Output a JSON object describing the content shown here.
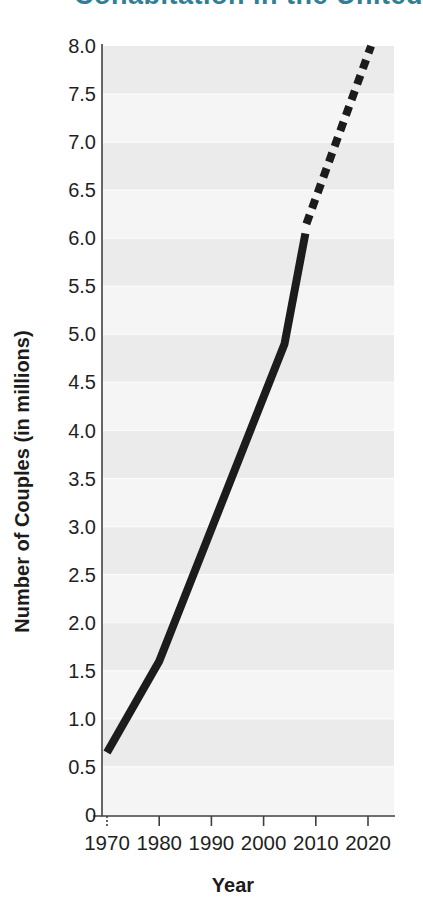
{
  "title": {
    "text": "Cohabitation in the United",
    "color": "#2f7f96",
    "note": "title clipped at top edge of screenshot"
  },
  "chart_data": {
    "type": "line",
    "title": "Cohabitation in the United",
    "xlabel": "Year",
    "ylabel": "Number of Couples (in millions)",
    "xlim": [
      1970,
      2022
    ],
    "ylim": [
      0,
      8.0
    ],
    "grid": "horizontal alternating bands every 0.5",
    "legend": "none",
    "x_ticks": [
      {
        "label": "1970",
        "year": 1970
      },
      {
        "label": "1980",
        "year": 1980
      },
      {
        "label": "1990",
        "year": 1990
      },
      {
        "label": "2000",
        "year": 2000
      },
      {
        "label": "2010",
        "year": 2010
      },
      {
        "label": "2020",
        "year": 2020
      }
    ],
    "y_ticks": [
      {
        "label": "0",
        "value": 0
      },
      {
        "label": "0.5",
        "value": 0.5
      },
      {
        "label": "1.0",
        "value": 1.0
      },
      {
        "label": "1.5",
        "value": 1.5
      },
      {
        "label": "2.0",
        "value": 2.0
      },
      {
        "label": "2.5",
        "value": 2.5
      },
      {
        "label": "3.0",
        "value": 3.0
      },
      {
        "label": "3.5",
        "value": 3.5
      },
      {
        "label": "4.0",
        "value": 4.0
      },
      {
        "label": "4.5",
        "value": 4.5
      },
      {
        "label": "5.0",
        "value": 5.0
      },
      {
        "label": "5.5",
        "value": 5.5
      },
      {
        "label": "6.0",
        "value": 6.0
      },
      {
        "label": "6.5",
        "value": 6.5
      },
      {
        "label": "7.0",
        "value": 7.0
      },
      {
        "label": "7.5",
        "value": 7.5
      },
      {
        "label": "8.0",
        "value": 8.0
      }
    ],
    "series": [
      {
        "name": "actual",
        "style": "solid",
        "points": [
          [
            1970,
            0.65
          ],
          [
            1980,
            1.6
          ],
          [
            2004,
            4.9
          ],
          [
            2008,
            6.05
          ]
        ]
      },
      {
        "name": "projected",
        "style": "dashed",
        "points": [
          [
            2008.2,
            6.15
          ],
          [
            2020.6,
            8.0
          ]
        ]
      }
    ],
    "line_color": "#1c1c1c",
    "axis_color": "#3f3f3f",
    "band_colors": [
      "#ebebeb",
      "#f5f5f5"
    ],
    "band_separator_color": "#fbfbfb"
  }
}
